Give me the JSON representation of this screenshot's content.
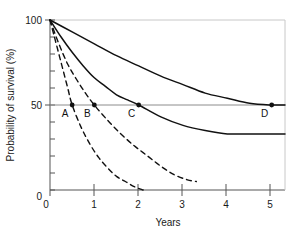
{
  "chart_data": {
    "type": "line",
    "title": "",
    "xlabel": "Years",
    "ylabel": "Probability of survival (%)",
    "xlim": [
      0,
      5.3
    ],
    "ylim": [
      0,
      100
    ],
    "xticks": [
      0,
      1,
      2,
      3,
      4,
      5
    ],
    "xtick_labels": [
      "0",
      "1",
      "2",
      "3",
      "4",
      "5"
    ],
    "yticks": [
      0,
      10,
      20,
      30,
      40,
      50,
      60,
      70,
      80,
      90,
      100
    ],
    "ytick_labels": [
      "0",
      "50",
      "100"
    ],
    "ylabeled_ticks": [
      0,
      50,
      100
    ],
    "grid": false,
    "legend": "none",
    "reference_lines": [
      {
        "name": "median-survival-line",
        "axis": "y",
        "value": 50
      }
    ],
    "series": [
      {
        "name": "Curve A",
        "style": "dashed",
        "median_survival_years": 0.5,
        "points": [
          [
            0,
            100
          ],
          [
            0.1,
            90
          ],
          [
            0.2,
            80
          ],
          [
            0.3,
            70
          ],
          [
            0.4,
            60
          ],
          [
            0.5,
            50
          ],
          [
            0.7,
            37
          ],
          [
            0.9,
            27
          ],
          [
            1.1,
            19
          ],
          [
            1.3,
            13
          ],
          [
            1.5,
            8
          ],
          [
            1.7,
            5
          ],
          [
            1.9,
            2
          ],
          [
            2.1,
            0
          ]
        ]
      },
      {
        "name": "Curve B",
        "style": "dashed",
        "median_survival_years": 1.0,
        "points": [
          [
            0,
            100
          ],
          [
            0.2,
            86
          ],
          [
            0.4,
            74
          ],
          [
            0.6,
            65
          ],
          [
            0.8,
            57
          ],
          [
            1.0,
            50
          ],
          [
            1.3,
            41
          ],
          [
            1.6,
            33
          ],
          [
            1.9,
            26
          ],
          [
            2.2,
            20
          ],
          [
            2.5,
            14
          ],
          [
            2.8,
            9
          ],
          [
            3.1,
            6
          ],
          [
            3.3,
            5
          ]
        ]
      },
      {
        "name": "Curve C",
        "style": "solid",
        "median_survival_years": 2.0,
        "points": [
          [
            0,
            100
          ],
          [
            0.25,
            90
          ],
          [
            0.5,
            81
          ],
          [
            0.75,
            73
          ],
          [
            1.0,
            66
          ],
          [
            1.25,
            61
          ],
          [
            1.5,
            56
          ],
          [
            1.75,
            53
          ],
          [
            2.0,
            50
          ],
          [
            2.5,
            43
          ],
          [
            3.0,
            38
          ],
          [
            3.5,
            35
          ],
          [
            4.0,
            33
          ],
          [
            4.5,
            33
          ],
          [
            5.3,
            33
          ]
        ]
      },
      {
        "name": "Curve D",
        "style": "solid",
        "median_survival_years": 5.0,
        "points": [
          [
            0,
            100
          ],
          [
            0.5,
            93
          ],
          [
            1.0,
            86
          ],
          [
            1.5,
            79
          ],
          [
            2.0,
            73
          ],
          [
            2.5,
            67
          ],
          [
            3.0,
            62
          ],
          [
            3.5,
            57
          ],
          [
            4.0,
            54
          ],
          [
            4.5,
            51
          ],
          [
            5.0,
            50
          ],
          [
            5.3,
            50
          ]
        ]
      }
    ],
    "annotations": [
      {
        "label": "A",
        "x": 0.5,
        "y": 50,
        "marker": true
      },
      {
        "label": "B",
        "x": 1.0,
        "y": 50,
        "marker": true
      },
      {
        "label": "C",
        "x": 2.0,
        "y": 50,
        "marker": true
      },
      {
        "label": "D",
        "x": 5.0,
        "y": 50,
        "marker": true
      }
    ]
  },
  "colors": {
    "line": "#111111",
    "frame": "#9a9a9a",
    "reference": "#888888",
    "text": "#1a1a1a",
    "background": "#ffffff"
  }
}
